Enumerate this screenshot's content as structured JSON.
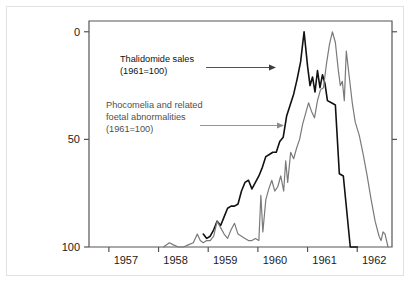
{
  "figure": {
    "background_color": "#ffffff",
    "border_color": "#e2e2e2",
    "plot_frame_color": "#555555"
  },
  "axes": {
    "y_tick_labels": [
      "100",
      "50",
      "0"
    ],
    "x_tick_labels": [
      "1957",
      "1958",
      "1959",
      "1960",
      "1961",
      "1962"
    ]
  },
  "annotations": {
    "thalidomide": {
      "line1": "Thalidomide sales",
      "line2": "(1961=100)",
      "color": "#111111"
    },
    "phocomelia": {
      "line1": "Phocomelia and related",
      "line2": "foetal abnormalities",
      "line3": "(1961=100)",
      "color": "#4f4f4f"
    }
  },
  "chart_data": {
    "type": "line",
    "title": "",
    "subtitle": "",
    "xlabel": "",
    "ylabel": "",
    "xlim": [
      1956.6,
      1962.7
    ],
    "ylim": [
      0,
      105
    ],
    "grid": false,
    "legend_position": "inline-annotations",
    "x_ticks": [
      1957,
      1958,
      1959,
      1960,
      1961,
      1962
    ],
    "y_ticks": [
      0,
      50,
      100
    ],
    "series": [
      {
        "name": "Thalidomide sales",
        "units": "(1961=100)",
        "color": "#111111",
        "line_width": 1.6,
        "points": [
          [
            1958.9,
            6
          ],
          [
            1958.97,
            4
          ],
          [
            1959.04,
            5
          ],
          [
            1959.11,
            8
          ],
          [
            1959.18,
            12
          ],
          [
            1959.25,
            10
          ],
          [
            1959.32,
            14
          ],
          [
            1959.39,
            18
          ],
          [
            1959.46,
            19
          ],
          [
            1959.53,
            19
          ],
          [
            1959.6,
            20
          ],
          [
            1959.67,
            26
          ],
          [
            1959.74,
            30
          ],
          [
            1959.81,
            31
          ],
          [
            1959.88,
            27
          ],
          [
            1959.95,
            30
          ],
          [
            1960.02,
            33
          ],
          [
            1960.09,
            37
          ],
          [
            1960.16,
            42
          ],
          [
            1960.23,
            43
          ],
          [
            1960.3,
            44
          ],
          [
            1960.37,
            44
          ],
          [
            1960.44,
            49
          ],
          [
            1960.51,
            51
          ],
          [
            1960.58,
            61
          ],
          [
            1960.65,
            66
          ],
          [
            1960.72,
            71
          ],
          [
            1960.79,
            78
          ],
          [
            1960.86,
            86
          ],
          [
            1960.93,
            100
          ],
          [
            1961.0,
            84
          ],
          [
            1961.05,
            75
          ],
          [
            1961.1,
            79
          ],
          [
            1961.15,
            72
          ],
          [
            1961.2,
            82
          ],
          [
            1961.25,
            74
          ],
          [
            1961.3,
            80
          ],
          [
            1961.35,
            76
          ],
          [
            1961.4,
            68
          ],
          [
            1961.48,
            67
          ],
          [
            1961.56,
            66
          ],
          [
            1961.64,
            34
          ],
          [
            1961.72,
            33
          ],
          [
            1961.86,
            0
          ],
          [
            1962.0,
            0
          ]
        ]
      },
      {
        "name": "Phocomelia and related foetal abnormalities",
        "units": "(1961=100)",
        "color": "#7a7a7a",
        "line_width": 1.2,
        "points": [
          [
            1958.1,
            0
          ],
          [
            1958.22,
            2
          ],
          [
            1958.3,
            1
          ],
          [
            1958.4,
            0
          ],
          [
            1958.5,
            0
          ],
          [
            1958.6,
            1
          ],
          [
            1958.7,
            2
          ],
          [
            1958.78,
            6
          ],
          [
            1958.84,
            3
          ],
          [
            1958.9,
            2
          ],
          [
            1958.97,
            3
          ],
          [
            1959.04,
            3
          ],
          [
            1959.11,
            5
          ],
          [
            1959.18,
            12
          ],
          [
            1959.25,
            9
          ],
          [
            1959.32,
            6
          ],
          [
            1959.39,
            4
          ],
          [
            1959.46,
            8
          ],
          [
            1959.53,
            11
          ],
          [
            1959.6,
            6
          ],
          [
            1959.67,
            5
          ],
          [
            1959.74,
            4
          ],
          [
            1959.81,
            3
          ],
          [
            1959.88,
            3
          ],
          [
            1959.95,
            4
          ],
          [
            1960.02,
            3
          ],
          [
            1960.06,
            24
          ],
          [
            1960.1,
            7
          ],
          [
            1960.16,
            22
          ],
          [
            1960.22,
            27
          ],
          [
            1960.28,
            31
          ],
          [
            1960.34,
            26
          ],
          [
            1960.4,
            28
          ],
          [
            1960.46,
            33
          ],
          [
            1960.52,
            26
          ],
          [
            1960.56,
            40
          ],
          [
            1960.6,
            30
          ],
          [
            1960.66,
            44
          ],
          [
            1960.72,
            41
          ],
          [
            1960.78,
            46
          ],
          [
            1960.84,
            50
          ],
          [
            1960.9,
            57
          ],
          [
            1960.96,
            62
          ],
          [
            1961.02,
            67
          ],
          [
            1961.08,
            63
          ],
          [
            1961.14,
            60
          ],
          [
            1961.2,
            68
          ],
          [
            1961.26,
            73
          ],
          [
            1961.32,
            74
          ],
          [
            1961.38,
            85
          ],
          [
            1961.44,
            94
          ],
          [
            1961.5,
            100
          ],
          [
            1961.56,
            95
          ],
          [
            1961.62,
            82
          ],
          [
            1961.66,
            75
          ],
          [
            1961.7,
            77
          ],
          [
            1961.74,
            68
          ],
          [
            1961.78,
            91
          ],
          [
            1961.84,
            79
          ],
          [
            1961.9,
            67
          ],
          [
            1961.96,
            58
          ],
          [
            1962.04,
            52
          ],
          [
            1962.12,
            43
          ],
          [
            1962.2,
            33
          ],
          [
            1962.28,
            22
          ],
          [
            1962.36,
            12
          ],
          [
            1962.44,
            5
          ],
          [
            1962.48,
            3
          ],
          [
            1962.52,
            7
          ],
          [
            1962.56,
            6
          ],
          [
            1962.62,
            0
          ]
        ]
      }
    ]
  }
}
